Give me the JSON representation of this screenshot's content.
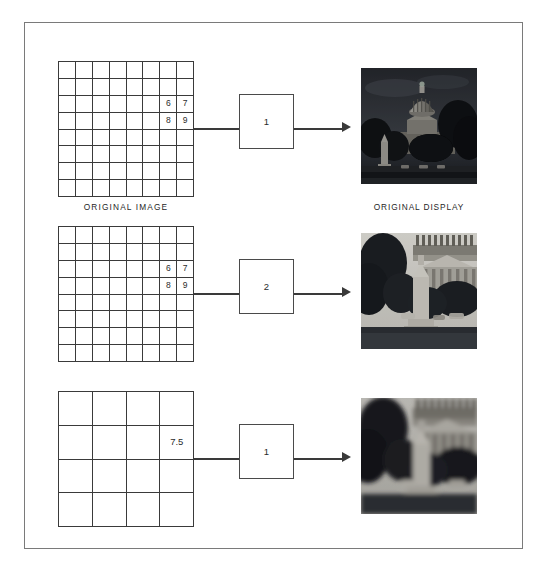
{
  "figure": {
    "title_visible": false,
    "background_color": "#ffffff",
    "border_color": "#7a7a7a",
    "line_color": "#3a3a3a"
  },
  "rows": [
    {
      "id": "row-original",
      "grid": {
        "columns": 8,
        "rows": 8,
        "values": [
          {
            "row": 3,
            "col": 7,
            "value": "6"
          },
          {
            "row": 3,
            "col": 8,
            "value": "7"
          },
          {
            "row": 4,
            "col": 7,
            "value": "8"
          },
          {
            "row": 4,
            "col": 8,
            "value": "9"
          }
        ]
      },
      "grid_caption": "ORIGINAL IMAGE",
      "box_label": "1",
      "photo_caption": "ORIGINAL DISPLAY",
      "photo_alt": "capitol-wide-dark"
    },
    {
      "id": "row-zoom-2x",
      "grid": {
        "columns": 8,
        "rows": 8,
        "values": [
          {
            "row": 3,
            "col": 7,
            "value": "6"
          },
          {
            "row": 3,
            "col": 8,
            "value": "7"
          },
          {
            "row": 4,
            "col": 7,
            "value": "8"
          },
          {
            "row": 4,
            "col": 8,
            "value": "9"
          }
        ]
      },
      "grid_caption": "",
      "box_label": "2",
      "photo_caption": "",
      "photo_alt": "capitol-zoom-sharp"
    },
    {
      "id": "row-interpolated",
      "grid": {
        "columns": 4,
        "rows": 4,
        "values": [
          {
            "row": 2,
            "col": 4,
            "value": "7.5"
          }
        ]
      },
      "grid_caption": "",
      "box_label": "1",
      "photo_caption": "",
      "photo_alt": "capitol-zoom-blurred"
    }
  ],
  "icons": {
    "arrow": "arrow-right-icon"
  }
}
